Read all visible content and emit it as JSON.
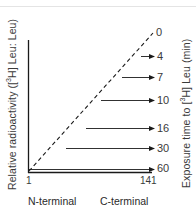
{
  "diagram": {
    "y_axis_label": {
      "prefix": "Relative radioactivity ([",
      "sup": "3",
      "suffix": "H] Leu: Leu)"
    },
    "right_axis_label": {
      "prefix": "Exposure time to [",
      "sup": "3",
      "suffix": "H] Leu (min)"
    },
    "x_ticks": [
      {
        "label": "1",
        "position": "left"
      },
      {
        "label": "141",
        "position": "right"
      }
    ],
    "x_terminal_labels": {
      "left": "N-terminal",
      "right": "C-terminal"
    },
    "diagonal": {
      "style": "dashed",
      "label": "0"
    },
    "arrows": [
      {
        "time": "4",
        "y": 56,
        "x_start": 141
      },
      {
        "time": "7",
        "y": 77,
        "x_start": 122
      },
      {
        "time": "10",
        "y": 100,
        "x_start": 101
      },
      {
        "time": "16",
        "y": 128,
        "x_start": 86
      },
      {
        "time": "30",
        "y": 148,
        "x_start": 66
      },
      {
        "time": "60",
        "y": 169,
        "x_start": 29
      }
    ],
    "colors": {
      "line": "#1a1a1a",
      "text": "#3a3a3a",
      "background": "#ffffff"
    }
  }
}
